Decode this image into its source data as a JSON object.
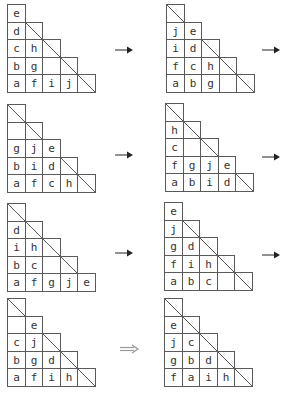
{
  "cell_size": 17.6,
  "colors": {
    "grid": "#5a5a5a",
    "text": "#333333",
    "solid_arrow": "#222222",
    "hollow_arrow": "#9a9a9a"
  },
  "panels": [
    {
      "id": "p1",
      "x": 7,
      "y": 4,
      "rows": [
        [
          {
            "t": "e"
          }
        ],
        [
          {
            "t": "d"
          },
          {
            "t": "",
            "d": true
          }
        ],
        [
          {
            "t": "c"
          },
          {
            "t": "h"
          },
          {
            "t": "",
            "d": true
          }
        ],
        [
          {
            "t": "b"
          },
          {
            "t": "g"
          },
          {
            "t": ""
          },
          {
            "t": "",
            "d": true
          }
        ],
        [
          {
            "t": "a"
          },
          {
            "t": "f"
          },
          {
            "t": "i"
          },
          {
            "t": "j"
          },
          {
            "t": "",
            "d": true
          }
        ]
      ]
    },
    {
      "id": "p2",
      "x": 166,
      "y": 4,
      "rows": [
        [
          {
            "t": "",
            "d": true
          }
        ],
        [
          {
            "t": "j"
          },
          {
            "t": "e"
          }
        ],
        [
          {
            "t": "i"
          },
          {
            "t": "d"
          },
          {
            "t": "",
            "d": true
          }
        ],
        [
          {
            "t": "f"
          },
          {
            "t": "c"
          },
          {
            "t": "h"
          },
          {
            "t": "",
            "d": true
          }
        ],
        [
          {
            "t": "a"
          },
          {
            "t": "b"
          },
          {
            "t": "g"
          },
          {
            "t": ""
          },
          {
            "t": "",
            "d": true
          }
        ]
      ]
    },
    {
      "id": "p3",
      "x": 7,
      "y": 104,
      "rows": [
        [
          {
            "t": "",
            "d": true
          }
        ],
        [
          {
            "t": ""
          },
          {
            "t": "",
            "d": true
          }
        ],
        [
          {
            "t": "g"
          },
          {
            "t": "j"
          },
          {
            "t": "e"
          }
        ],
        [
          {
            "t": "b"
          },
          {
            "t": "i"
          },
          {
            "t": "d"
          },
          {
            "t": "",
            "d": true
          }
        ],
        [
          {
            "t": "a"
          },
          {
            "t": "f"
          },
          {
            "t": "c"
          },
          {
            "t": "h"
          },
          {
            "t": "",
            "d": true
          }
        ]
      ]
    },
    {
      "id": "p4",
      "x": 165,
      "y": 103,
      "rows": [
        [
          {
            "t": "",
            "d": true
          }
        ],
        [
          {
            "t": "h"
          },
          {
            "t": "",
            "d": true
          }
        ],
        [
          {
            "t": "c"
          },
          {
            "t": ""
          },
          {
            "t": "",
            "d": true
          }
        ],
        [
          {
            "t": "f"
          },
          {
            "t": "g"
          },
          {
            "t": "j"
          },
          {
            "t": "e"
          }
        ],
        [
          {
            "t": "a"
          },
          {
            "t": "b"
          },
          {
            "t": "i"
          },
          {
            "t": "d"
          },
          {
            "t": "",
            "d": true
          }
        ]
      ]
    },
    {
      "id": "p5",
      "x": 7,
      "y": 203,
      "rows": [
        [
          {
            "t": "",
            "d": true
          }
        ],
        [
          {
            "t": "d"
          },
          {
            "t": "",
            "d": true
          }
        ],
        [
          {
            "t": "i"
          },
          {
            "t": "h"
          },
          {
            "t": "",
            "d": true
          }
        ],
        [
          {
            "t": "b"
          },
          {
            "t": "c"
          },
          {
            "t": ""
          },
          {
            "t": "",
            "d": true
          }
        ],
        [
          {
            "t": "a"
          },
          {
            "t": "f"
          },
          {
            "t": "g"
          },
          {
            "t": "j"
          },
          {
            "t": "e"
          }
        ]
      ]
    },
    {
      "id": "p6",
      "x": 164,
      "y": 202,
      "rows": [
        [
          {
            "t": "e"
          }
        ],
        [
          {
            "t": "j"
          },
          {
            "t": "",
            "d": true
          }
        ],
        [
          {
            "t": "g"
          },
          {
            "t": "d"
          },
          {
            "t": "",
            "d": true
          }
        ],
        [
          {
            "t": "f"
          },
          {
            "t": "i"
          },
          {
            "t": "h"
          },
          {
            "t": "",
            "d": true
          }
        ],
        [
          {
            "t": "a"
          },
          {
            "t": "b"
          },
          {
            "t": "c"
          },
          {
            "t": ""
          },
          {
            "t": "",
            "d": true
          }
        ]
      ]
    },
    {
      "id": "p7",
      "x": 7,
      "y": 298,
      "rows": [
        [
          {
            "t": "",
            "d": true
          }
        ],
        [
          {
            "t": ""
          },
          {
            "t": "e"
          }
        ],
        [
          {
            "t": "c"
          },
          {
            "t": "j"
          },
          {
            "t": "",
            "d": true
          }
        ],
        [
          {
            "t": "b"
          },
          {
            "t": "g"
          },
          {
            "t": "d"
          },
          {
            "t": "",
            "d": true
          }
        ],
        [
          {
            "t": "a"
          },
          {
            "t": "f"
          },
          {
            "t": "i"
          },
          {
            "t": "h"
          },
          {
            "t": "",
            "d": true
          }
        ]
      ]
    },
    {
      "id": "p8",
      "x": 164,
      "y": 298,
      "rows": [
        [
          {
            "t": "",
            "d": true
          }
        ],
        [
          {
            "t": "e"
          },
          {
            "t": "",
            "d": true
          }
        ],
        [
          {
            "t": "j"
          },
          {
            "t": "c"
          },
          {
            "t": "",
            "d": true
          }
        ],
        [
          {
            "t": "g"
          },
          {
            "t": "b"
          },
          {
            "t": "d"
          },
          {
            "t": "",
            "d": true
          }
        ],
        [
          {
            "t": "f"
          },
          {
            "t": "a"
          },
          {
            "t": "i"
          },
          {
            "t": "h"
          },
          {
            "t": "",
            "d": true
          }
        ]
      ]
    }
  ],
  "arrows": [
    {
      "type": "solid",
      "x": 115,
      "y": 50,
      "w": 18
    },
    {
      "type": "solid",
      "x": 262,
      "y": 50,
      "w": 18
    },
    {
      "type": "solid",
      "x": 115,
      "y": 155,
      "w": 18
    },
    {
      "type": "solid",
      "x": 262,
      "y": 157,
      "w": 18
    },
    {
      "type": "solid",
      "x": 115,
      "y": 253,
      "w": 18
    },
    {
      "type": "solid",
      "x": 262,
      "y": 255,
      "w": 18
    },
    {
      "type": "hollow",
      "x": 120,
      "y": 349,
      "w": 18
    }
  ]
}
